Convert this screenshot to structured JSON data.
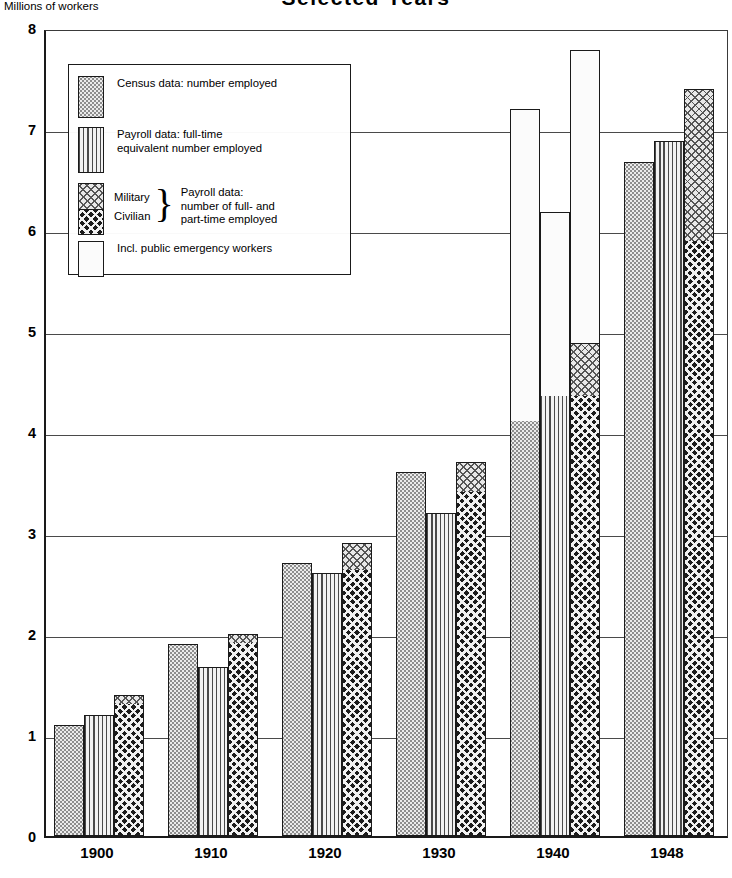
{
  "chart_title": "Selected Years",
  "y_axis_caption": "Millions of workers",
  "legend": {
    "items": [
      {
        "pattern": "census",
        "label": "Census data: number employed"
      },
      {
        "pattern": "fte",
        "label": "Payroll data: full-time\nequivalent number employed"
      },
      {
        "pattern": "split",
        "label_top": "Military",
        "label_bottom": "Civilian",
        "brace": "}",
        "desc": "Payroll data:\nnumber of full- and\npart-time employed"
      },
      {
        "pattern": "emergency",
        "label": "Incl. public emergency workers"
      }
    ]
  },
  "chart_data": {
    "type": "bar",
    "title": "Selected Years",
    "xlabel": "",
    "ylabel": "Millions of workers",
    "ylim": [
      0,
      8
    ],
    "ytick_labels": [
      "0",
      "1",
      "2",
      "3",
      "4",
      "5",
      "6",
      "7",
      "8"
    ],
    "yticks": [
      0,
      1,
      2,
      3,
      4,
      5,
      6,
      7,
      8
    ],
    "grid": true,
    "legend_position": "upper-left-inside",
    "categories": [
      "1900",
      "1910",
      "1920",
      "1930",
      "1940",
      "1948"
    ],
    "series": [
      {
        "name": "Census data: number employed",
        "pattern": "census",
        "values": [
          1.1,
          1.9,
          2.7,
          3.6,
          4.1,
          6.67
        ]
      },
      {
        "name": "Payroll data: full-time equivalent number employed",
        "pattern": "fte",
        "values": [
          1.2,
          1.67,
          2.6,
          3.2,
          5.85,
          6.88
        ]
      },
      {
        "name": "Payroll data: civilian, full- and part-time",
        "pattern": "civilian",
        "values": [
          1.3,
          1.9,
          2.62,
          3.4,
          4.35,
          5.88
        ]
      },
      {
        "name": "Payroll data: military, full- and part-time",
        "pattern": "military",
        "values": [
          1.4,
          2.0,
          2.9,
          3.7,
          4.87,
          7.4
        ]
      },
      {
        "name": "Incl. public emergency workers",
        "pattern": "emergency",
        "values": [
          null,
          null,
          null,
          null,
          7.2,
          null
        ]
      }
    ],
    "bars": [
      {
        "year": "1900",
        "bar": 1,
        "segments": [
          {
            "pattern": "census",
            "from": 0,
            "to": 1.1
          }
        ]
      },
      {
        "year": "1900",
        "bar": 2,
        "segments": [
          {
            "pattern": "fte",
            "from": 0,
            "to": 1.2
          }
        ]
      },
      {
        "year": "1900",
        "bar": 3,
        "segments": [
          {
            "pattern": "civilian",
            "from": 0,
            "to": 1.3
          },
          {
            "pattern": "military",
            "from": 1.3,
            "to": 1.4
          }
        ]
      },
      {
        "year": "1910",
        "bar": 1,
        "segments": [
          {
            "pattern": "census",
            "from": 0,
            "to": 1.9
          }
        ]
      },
      {
        "year": "1910",
        "bar": 2,
        "segments": [
          {
            "pattern": "fte",
            "from": 0,
            "to": 1.67
          }
        ]
      },
      {
        "year": "1910",
        "bar": 3,
        "segments": [
          {
            "pattern": "civilian",
            "from": 0,
            "to": 1.9
          },
          {
            "pattern": "military",
            "from": 1.9,
            "to": 2.0
          }
        ]
      },
      {
        "year": "1920",
        "bar": 1,
        "segments": [
          {
            "pattern": "census",
            "from": 0,
            "to": 2.7
          }
        ]
      },
      {
        "year": "1920",
        "bar": 2,
        "segments": [
          {
            "pattern": "fte",
            "from": 0,
            "to": 2.6
          }
        ]
      },
      {
        "year": "1920",
        "bar": 3,
        "segments": [
          {
            "pattern": "civilian",
            "from": 0,
            "to": 2.62
          },
          {
            "pattern": "military",
            "from": 2.62,
            "to": 2.9
          }
        ]
      },
      {
        "year": "1930",
        "bar": 1,
        "segments": [
          {
            "pattern": "census",
            "from": 0,
            "to": 3.6
          }
        ]
      },
      {
        "year": "1930",
        "bar": 2,
        "segments": [
          {
            "pattern": "fte",
            "from": 0,
            "to": 3.2
          }
        ]
      },
      {
        "year": "1930",
        "bar": 3,
        "segments": [
          {
            "pattern": "civilian",
            "from": 0,
            "to": 3.4
          },
          {
            "pattern": "military",
            "from": 3.4,
            "to": 3.7
          }
        ]
      },
      {
        "year": "1940",
        "bar": 1,
        "segments": [
          {
            "pattern": "census",
            "from": 0,
            "to": 4.1
          },
          {
            "pattern": "emergency",
            "from": 4.1,
            "to": 7.2
          }
        ]
      },
      {
        "year": "1940",
        "bar": 2,
        "segments": [
          {
            "pattern": "fte",
            "from": 0,
            "to": 4.35
          },
          {
            "pattern": "emergency",
            "from": 4.35,
            "to": 6.18
          }
        ]
      },
      {
        "year": "1940",
        "bar": 3,
        "segments": [
          {
            "pattern": "civilian",
            "from": 0,
            "to": 4.35
          },
          {
            "pattern": "military",
            "from": 4.35,
            "to": 4.87
          },
          {
            "pattern": "emergency",
            "from": 4.87,
            "to": 7.78
          }
        ]
      },
      {
        "year": "1948",
        "bar": 1,
        "segments": [
          {
            "pattern": "census",
            "from": 0,
            "to": 6.67
          }
        ]
      },
      {
        "year": "1948",
        "bar": 2,
        "segments": [
          {
            "pattern": "fte",
            "from": 0,
            "to": 6.88
          }
        ]
      },
      {
        "year": "1948",
        "bar": 3,
        "segments": [
          {
            "pattern": "civilian",
            "from": 0,
            "to": 5.88
          },
          {
            "pattern": "military",
            "from": 5.88,
            "to": 7.4
          }
        ]
      }
    ]
  }
}
